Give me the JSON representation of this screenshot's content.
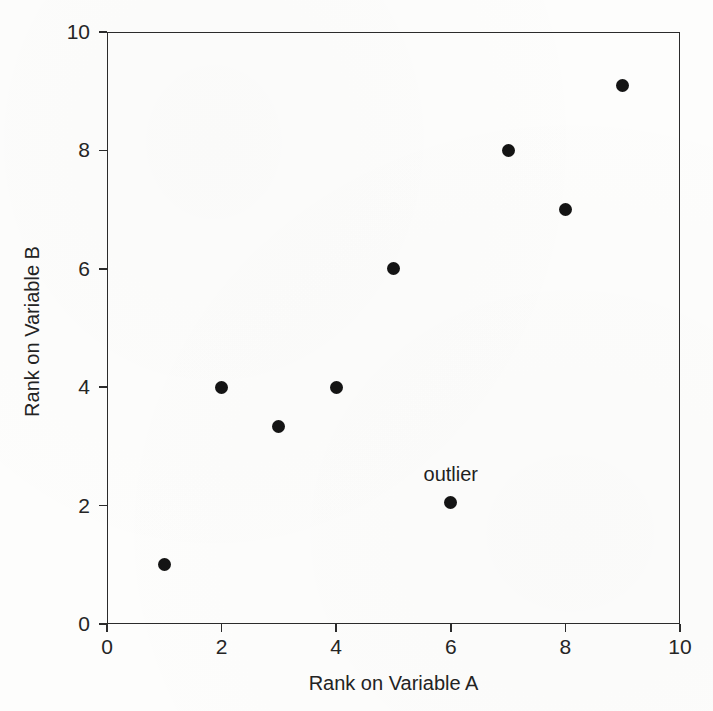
{
  "chart_data": {
    "type": "scatter",
    "title": "",
    "xlabel": "Rank on Variable A",
    "ylabel": "Rank on Variable B",
    "xlim": [
      0,
      10
    ],
    "ylim": [
      0,
      10
    ],
    "xticks": [
      "0",
      "2",
      "4",
      "6",
      "8",
      "10"
    ],
    "xtick_values": [
      0,
      2,
      4,
      6,
      8,
      10
    ],
    "yticks": [
      "0",
      "2",
      "4",
      "6",
      "8",
      "10"
    ],
    "ytick_values": [
      0,
      2,
      4,
      6,
      8,
      10
    ],
    "grid": false,
    "legend": false,
    "marker_color": "#141414",
    "axis_color": "#2b2b2b",
    "background_color": "#fdfdfc",
    "points": [
      {
        "x": 1,
        "y": 1.0
      },
      {
        "x": 2,
        "y": 4.0
      },
      {
        "x": 3,
        "y": 3.33
      },
      {
        "x": 4,
        "y": 4.0
      },
      {
        "x": 5,
        "y": 6.0
      },
      {
        "x": 6,
        "y": 2.05
      },
      {
        "x": 7,
        "y": 8.0
      },
      {
        "x": 8,
        "y": 7.0
      },
      {
        "x": 9,
        "y": 9.1
      }
    ],
    "annotations": [
      {
        "text": "outlier",
        "x": 6,
        "y": 2.05,
        "dy_px": -22
      }
    ]
  }
}
